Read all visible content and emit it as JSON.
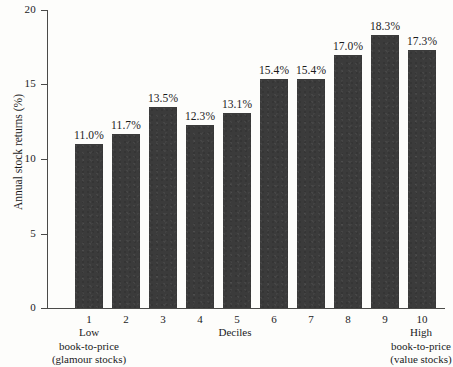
{
  "chart_data": {
    "type": "bar",
    "title": "",
    "xlabel": "Deciles",
    "ylabel": "Annual stock returns (%)",
    "categories": [
      "1",
      "2",
      "3",
      "4",
      "5",
      "6",
      "7",
      "8",
      "9",
      "10"
    ],
    "values": [
      11.0,
      11.7,
      13.5,
      12.3,
      13.1,
      15.4,
      15.4,
      17.0,
      18.3,
      17.3
    ],
    "data_labels": [
      "11.0%",
      "11.7%",
      "13.5%",
      "12.3%",
      "13.1%",
      "15.4%",
      "15.4%",
      "17.0%",
      "18.3%",
      "17.3%"
    ],
    "ylim": [
      0,
      20
    ],
    "yticks": [
      "0",
      "5",
      "10",
      "15",
      "20"
    ],
    "grid": false,
    "legend": false,
    "bar_color": "#3b3b3b",
    "axis_color": "#4a4a48",
    "background_color": "#fdfdfb",
    "annotations": {
      "left_caption": [
        "Low",
        "book-to-price",
        "(glamour stocks)"
      ],
      "right_caption": [
        "High",
        "book-to-price",
        "(value stocks)"
      ]
    }
  }
}
